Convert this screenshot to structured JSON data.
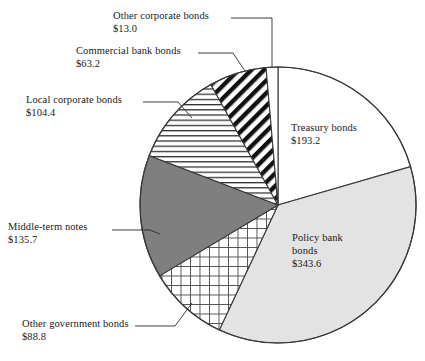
{
  "chart_data": {
    "type": "pie",
    "title": "",
    "subtitle": "",
    "unit": "$",
    "total": 941.9,
    "start_angle_deg": 0,
    "direction": "clockwise",
    "legend": "none",
    "grid": false,
    "labels": [
      "Treasury bonds",
      "Policy bank bonds",
      "Other government bonds",
      "Middle-term notes",
      "Local corporate bonds",
      "Commercial bank bonds",
      "Other corporate bonds"
    ],
    "values": [
      193.2,
      343.6,
      88.8,
      135.7,
      104.4,
      63.2,
      13.0
    ],
    "value_labels": [
      "$193.2",
      "$343.6",
      "$88.8",
      "$135.7",
      "$104.4",
      "$63.2",
      "$13.0"
    ],
    "slices": [
      {
        "name": "Treasury bonds",
        "value": 193.2,
        "value_label": "$193.2",
        "fill": "#ffffff",
        "pattern": "solid-white",
        "label_placement": "inside"
      },
      {
        "name": "Policy bank bonds",
        "value": 343.6,
        "value_label": "$343.6",
        "fill": "#e3e3e3",
        "pattern": "solid-light-gray",
        "label_placement": "inside"
      },
      {
        "name": "Other government bonds",
        "value": 88.8,
        "value_label": "$88.8",
        "fill": "#ffffff",
        "pattern": "cross-hatch-grid",
        "label_placement": "callout"
      },
      {
        "name": "Middle-term notes",
        "value": 135.7,
        "value_label": "$135.7",
        "fill": "#7f7f7f",
        "pattern": "solid-dark-gray",
        "label_placement": "callout"
      },
      {
        "name": "Local corporate bonds",
        "value": 104.4,
        "value_label": "$104.4",
        "fill": "#ffffff",
        "pattern": "horizontal-lines",
        "label_placement": "callout"
      },
      {
        "name": "Commercial bank bonds",
        "value": 63.2,
        "value_label": "$63.2",
        "fill": "#ffffff",
        "pattern": "diagonal-stripes",
        "label_placement": "callout"
      },
      {
        "name": "Other corporate bonds",
        "value": 13.0,
        "value_label": "$13.0",
        "fill": "#ffffff",
        "pattern": "solid-white",
        "label_placement": "callout"
      }
    ]
  },
  "callouts": {
    "other_corporate": {
      "name": "Other corporate bonds",
      "value": "$13.0"
    },
    "commercial_bank": {
      "name": "Commercial bank bonds",
      "value": "$63.2"
    },
    "local_corporate": {
      "name": "Local corporate bonds",
      "value": "$104.4"
    },
    "middle_term": {
      "name": "Middle-term notes",
      "value": "$135.7"
    },
    "other_government": {
      "name": "Other government bonds",
      "value": "$88.8"
    }
  },
  "inside_labels": {
    "treasury": {
      "name": "Treasury bonds",
      "value": "$193.2"
    },
    "policy_bank": {
      "name_line1": "Policy bank",
      "name_line2": "bonds",
      "value": "$343.6"
    }
  },
  "colors": {
    "stroke": "#3a3a3a",
    "dark_gray": "#7f7f7f",
    "light_gray": "#e3e3e3",
    "white": "#ffffff",
    "text": "#1a1a1a"
  }
}
